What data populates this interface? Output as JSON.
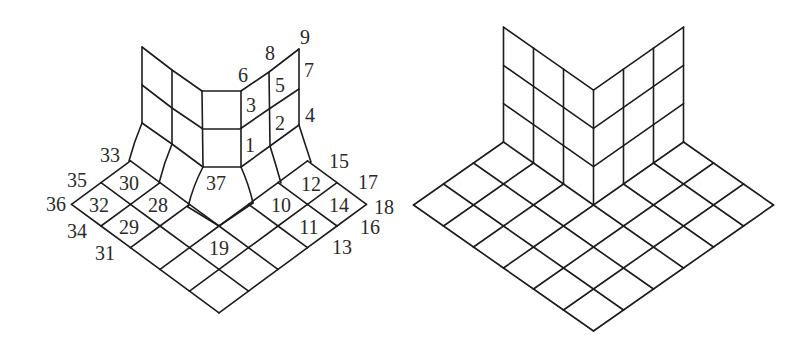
{
  "figure": {
    "left_panel": {
      "description": "Fillet corner mesh with numbered nodes",
      "node_labels": [
        {
          "text": "1",
          "x": 250,
          "y": 145
        },
        {
          "text": "2",
          "x": 280,
          "y": 123
        },
        {
          "text": "3",
          "x": 251,
          "y": 105
        },
        {
          "text": "4",
          "x": 310,
          "y": 115
        },
        {
          "text": "5",
          "x": 280,
          "y": 85
        },
        {
          "text": "6",
          "x": 243,
          "y": 75
        },
        {
          "text": "7",
          "x": 309,
          "y": 70
        },
        {
          "text": "8",
          "x": 270,
          "y": 53
        },
        {
          "text": "9",
          "x": 305,
          "y": 37
        },
        {
          "text": "10",
          "x": 281,
          "y": 205
        },
        {
          "text": "11",
          "x": 309,
          "y": 227
        },
        {
          "text": "12",
          "x": 311,
          "y": 184
        },
        {
          "text": "13",
          "x": 342,
          "y": 247
        },
        {
          "text": "14",
          "x": 339,
          "y": 205
        },
        {
          "text": "15",
          "x": 339,
          "y": 161
        },
        {
          "text": "16",
          "x": 370,
          "y": 227
        },
        {
          "text": "17",
          "x": 368,
          "y": 182
        },
        {
          "text": "18",
          "x": 384,
          "y": 207
        },
        {
          "text": "19",
          "x": 219,
          "y": 248
        },
        {
          "text": "28",
          "x": 158,
          "y": 205
        },
        {
          "text": "29",
          "x": 129,
          "y": 227
        },
        {
          "text": "30",
          "x": 129,
          "y": 183
        },
        {
          "text": "31",
          "x": 105,
          "y": 253
        },
        {
          "text": "32",
          "x": 99,
          "y": 205
        },
        {
          "text": "33",
          "x": 110,
          "y": 155
        },
        {
          "text": "34",
          "x": 77,
          "y": 231
        },
        {
          "text": "35",
          "x": 77,
          "y": 180
        },
        {
          "text": "36",
          "x": 56,
          "y": 204
        },
        {
          "text": "37",
          "x": 216,
          "y": 183
        }
      ]
    },
    "right_panel": {
      "description": "Sharp corner mesh without labels",
      "node_labels": []
    }
  }
}
